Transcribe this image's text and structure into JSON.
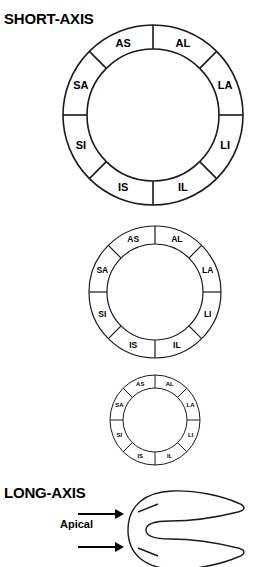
{
  "headings": {
    "short_axis": "SHORT-AXIS",
    "long_axis": "LONG-AXIS"
  },
  "segment_labels": {
    "AS": "AS",
    "AL": "AL",
    "LA": "LA",
    "LI": "LI",
    "IL": "IL",
    "IS": "IS",
    "SI": "SI",
    "SA": "SA"
  },
  "rings": [
    {
      "id": "large",
      "name": "basal-ring",
      "center_x": 153,
      "center_y": 115,
      "outer_radius": 90,
      "inner_radius": 66,
      "stroke_width": 1.6,
      "label_font_size": 11,
      "label_radius": 78,
      "segments": [
        {
          "label": "AL",
          "start_angle": -90,
          "end_angle": -45
        },
        {
          "label": "LA",
          "start_angle": -45,
          "end_angle": 0
        },
        {
          "label": "LI",
          "start_angle": 0,
          "end_angle": 45
        },
        {
          "label": "IL",
          "start_angle": 45,
          "end_angle": 90
        },
        {
          "label": "IS",
          "start_angle": 90,
          "end_angle": 135
        },
        {
          "label": "SI",
          "start_angle": 135,
          "end_angle": 180
        },
        {
          "label": "SA",
          "start_angle": 180,
          "end_angle": 225
        },
        {
          "label": "AS",
          "start_angle": 225,
          "end_angle": 270
        }
      ]
    },
    {
      "id": "medium",
      "name": "mid-ring",
      "center_x": 155,
      "center_y": 292,
      "outer_radius": 66,
      "inner_radius": 48,
      "stroke_width": 1.2,
      "label_font_size": 8.5,
      "label_radius": 57,
      "segments": [
        {
          "label": "AL",
          "start_angle": -90,
          "end_angle": -45
        },
        {
          "label": "LA",
          "start_angle": -45,
          "end_angle": 0
        },
        {
          "label": "LI",
          "start_angle": 0,
          "end_angle": 45
        },
        {
          "label": "IL",
          "start_angle": 45,
          "end_angle": 90
        },
        {
          "label": "IS",
          "start_angle": 90,
          "end_angle": 135
        },
        {
          "label": "SI",
          "start_angle": 135,
          "end_angle": 180
        },
        {
          "label": "SA",
          "start_angle": 180,
          "end_angle": 225
        },
        {
          "label": "AS",
          "start_angle": 225,
          "end_angle": 270
        }
      ]
    },
    {
      "id": "small",
      "name": "apical-ring",
      "center_x": 155,
      "center_y": 420,
      "outer_radius": 45,
      "inner_radius": 32,
      "stroke_width": 1.0,
      "label_font_size": 6,
      "label_radius": 38.5,
      "segments": [
        {
          "label": "AL",
          "start_angle": -90,
          "end_angle": -45
        },
        {
          "label": "LA",
          "start_angle": -45,
          "end_angle": 0
        },
        {
          "label": "LI",
          "start_angle": 0,
          "end_angle": 45
        },
        {
          "label": "IL",
          "start_angle": 45,
          "end_angle": 90
        },
        {
          "label": "IS",
          "start_angle": 90,
          "end_angle": 135
        },
        {
          "label": "SI",
          "start_angle": 135,
          "end_angle": 180
        },
        {
          "label": "SA",
          "start_angle": 180,
          "end_angle": 225
        },
        {
          "label": "AS",
          "start_angle": 225,
          "end_angle": 270
        }
      ]
    }
  ],
  "long_axis": {
    "apical_label": "Apical",
    "arrows": [
      {
        "x1": 78,
        "y1": 514,
        "x2": 124,
        "y2": 514
      },
      {
        "x1": 78,
        "y1": 547,
        "x2": 124,
        "y2": 547
      }
    ]
  },
  "colors": {
    "stroke": "#1a1a1a",
    "text": "#000000",
    "background": "#ffffff"
  }
}
